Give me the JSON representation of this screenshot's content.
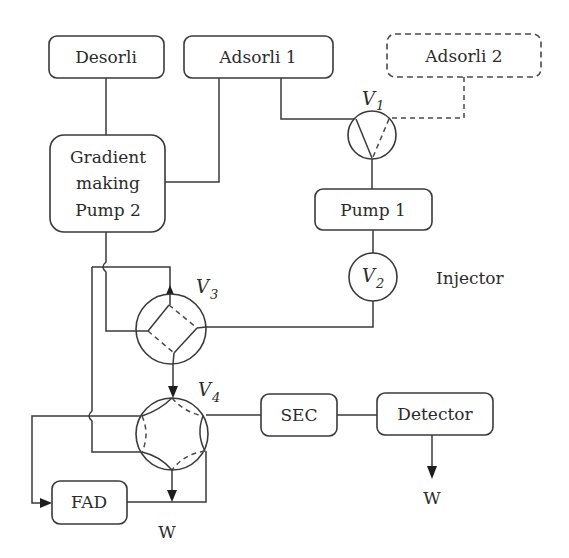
{
  "diagram": {
    "colors": {
      "stroke": "#3a3a3a",
      "text": "#2b2b2b",
      "background": "#ffffff"
    },
    "boxes": {
      "desorli": "Desorli",
      "adsorli1": "Adsorli 1",
      "adsorli2": "Adsorli 2",
      "gradient_line1": "Gradient",
      "gradient_line2": "making",
      "gradient_line3": "Pump 2",
      "pump1": "Pump 1",
      "sec": "SEC",
      "detector": "Detector",
      "fad": "FAD"
    },
    "valves": {
      "v1": {
        "letter": "V",
        "sub": "1"
      },
      "v2": {
        "letter": "V",
        "sub": "2"
      },
      "v3": {
        "letter": "V",
        "sub": "3"
      },
      "v4": {
        "letter": "V",
        "sub": "4"
      }
    },
    "labels": {
      "injector": "Injector",
      "waste_fad": "W",
      "waste_detector": "W"
    }
  }
}
